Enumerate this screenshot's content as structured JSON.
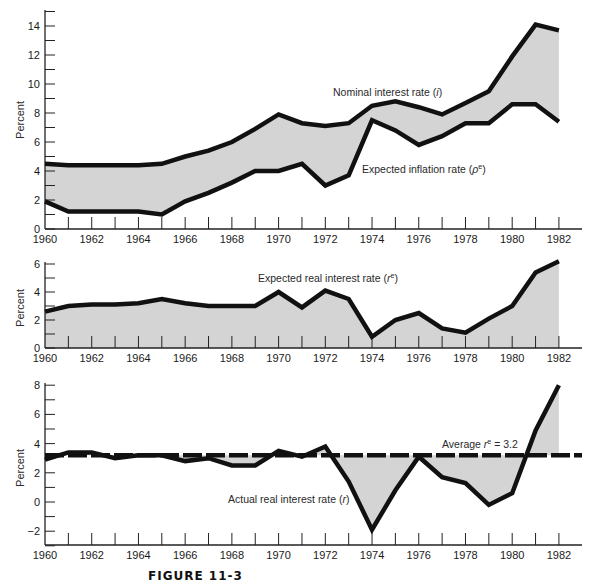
{
  "figure_title": "FIGURE 11-3",
  "colors": {
    "fill": "#d4d4d4",
    "line": "#111111",
    "axis": "#222222"
  },
  "chart_data": [
    {
      "type": "area",
      "panel": "top",
      "title": "",
      "xlabel": "",
      "ylabel": "Percent",
      "ylim": [
        0,
        15
      ],
      "yticks": [
        0,
        2,
        4,
        6,
        8,
        10,
        12,
        14
      ],
      "xticks": [
        1960,
        1962,
        1964,
        1966,
        1968,
        1970,
        1972,
        1974,
        1976,
        1978,
        1980,
        1982
      ],
      "x": [
        1960,
        1961,
        1962,
        1963,
        1964,
        1965,
        1966,
        1967,
        1968,
        1969,
        1970,
        1971,
        1972,
        1973,
        1974,
        1975,
        1976,
        1977,
        1978,
        1979,
        1980,
        1981,
        1982
      ],
      "series": [
        {
          "name": "Nominal interest rate (i)",
          "values": [
            4.5,
            4.4,
            4.4,
            4.4,
            4.4,
            4.5,
            5.0,
            5.4,
            6.0,
            6.9,
            7.9,
            7.3,
            7.1,
            7.3,
            8.5,
            8.8,
            8.4,
            7.9,
            8.7,
            9.5,
            11.9,
            14.1,
            13.7
          ]
        },
        {
          "name": "Expected inflation rate (pe)",
          "values": [
            1.9,
            1.2,
            1.2,
            1.2,
            1.2,
            1.0,
            1.9,
            2.5,
            3.2,
            4.0,
            4.0,
            4.5,
            3.0,
            3.7,
            7.5,
            6.8,
            5.8,
            6.4,
            7.3,
            7.3,
            8.6,
            8.6,
            7.4
          ]
        }
      ],
      "annotations": [
        {
          "text": "Nominal interest rate (i)",
          "x": 1973.5,
          "y": 9.4
        },
        {
          "text": "Expected inflation rate (ρe)",
          "x": 1975,
          "y": 4.1
        }
      ],
      "grid": false,
      "shading": "between series"
    },
    {
      "type": "area",
      "panel": "middle",
      "title": "",
      "xlabel": "",
      "ylabel": "Percent",
      "ylim": [
        0,
        6
      ],
      "yticks": [
        0,
        2,
        4,
        6
      ],
      "xticks": [
        1960,
        1962,
        1964,
        1966,
        1968,
        1970,
        1972,
        1974,
        1976,
        1978,
        1980,
        1982
      ],
      "x": [
        1960,
        1961,
        1962,
        1963,
        1964,
        1965,
        1966,
        1967,
        1968,
        1969,
        1970,
        1971,
        1972,
        1973,
        1974,
        1975,
        1976,
        1977,
        1978,
        1979,
        1980,
        1981,
        1982
      ],
      "series": [
        {
          "name": "Expected real interest rate (re)",
          "values": [
            2.6,
            3.0,
            3.1,
            3.1,
            3.2,
            3.5,
            3.2,
            3.0,
            3.0,
            3.0,
            4.0,
            2.9,
            4.1,
            3.5,
            0.8,
            2.0,
            2.5,
            1.4,
            1.1,
            2.1,
            3.0,
            5.4,
            6.2
          ]
        }
      ],
      "annotations": [
        {
          "text": "Expected real interest rate (re)",
          "x": 1970.5,
          "y": 5.2
        }
      ],
      "grid": false,
      "shading": "below series"
    },
    {
      "type": "area",
      "panel": "bottom",
      "title": "",
      "xlabel": "",
      "ylabel": "Percent",
      "ylim": [
        -3,
        8
      ],
      "yticks": [
        -2,
        0,
        2,
        4,
        6,
        8
      ],
      "xticks": [
        1960,
        1962,
        1964,
        1966,
        1968,
        1970,
        1972,
        1974,
        1976,
        1978,
        1980,
        1982
      ],
      "x": [
        1960,
        1961,
        1962,
        1963,
        1964,
        1965,
        1966,
        1967,
        1968,
        1969,
        1970,
        1971,
        1972,
        1973,
        1974,
        1975,
        1976,
        1977,
        1978,
        1979,
        1980,
        1981,
        1982
      ],
      "series": [
        {
          "name": "Actual real interest rate (r)",
          "values": [
            2.9,
            3.4,
            3.4,
            3.0,
            3.2,
            3.2,
            2.8,
            3.0,
            2.5,
            2.5,
            3.5,
            3.1,
            3.8,
            1.4,
            -1.9,
            0.8,
            3.1,
            1.7,
            1.3,
            -0.2,
            0.6,
            4.9,
            8.0
          ]
        }
      ],
      "reference_line": {
        "label": "Average re = 3.2",
        "value": 3.2,
        "style": "dashed"
      },
      "annotations": [
        {
          "text": "Average re = 3.2",
          "x": 1977.9,
          "y": 3.9
        },
        {
          "text": "Actual real interest rate (r)",
          "x": 1970,
          "y": 0.1
        }
      ],
      "grid": false,
      "shading": "between series and reference line"
    }
  ],
  "labels": {
    "ylabel": "Percent",
    "top_nominal": "Nominal interest rate (",
    "top_nominal_sym": "i",
    "top_expected": "Expected inflation rate (",
    "top_expected_sym": "ρ",
    "sup_e": "e",
    "close_paren": ")",
    "mid_expected_real": "Expected real interest rate (",
    "mid_sym": "r",
    "bot_average": "Average ",
    "bot_average_sym": "r",
    "bot_average_val": " = 3.2",
    "bot_actual": "Actual real interest rate (",
    "bot_actual_sym": "r"
  }
}
